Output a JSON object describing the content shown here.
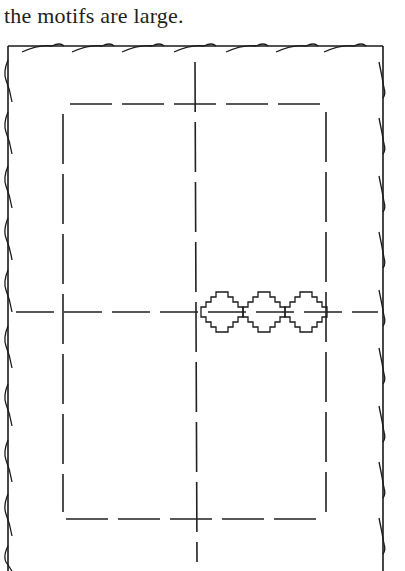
{
  "caption": {
    "text": "the motifs are large."
  },
  "diagram": {
    "outer_edge": {
      "stitch": "overcast-edge",
      "color": "#1a1a1a"
    },
    "inner_border": {
      "style": "dashed-tacking",
      "color": "#222222"
    },
    "centre_lines": {
      "vertical": "dashed",
      "horizontal": "dashed"
    },
    "motifs": [
      {
        "name": "stepped-motif-1",
        "cx": 222,
        "cy": 312
      },
      {
        "name": "stepped-motif-2",
        "cx": 264,
        "cy": 312
      },
      {
        "name": "stepped-motif-3",
        "cx": 306,
        "cy": 312
      }
    ],
    "motif_count": "3"
  }
}
